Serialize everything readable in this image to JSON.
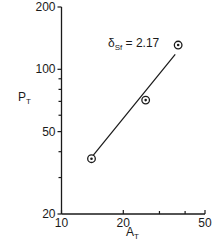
{
  "chart_data": {
    "type": "scatter",
    "title": "",
    "xlabel": "A_T",
    "ylabel": "P_T",
    "xlabel_main": "A",
    "xlabel_sub": "T",
    "ylabel_main": "P",
    "ylabel_sub": "T",
    "xscale": "log",
    "yscale": "log",
    "xlim": [
      10,
      50
    ],
    "ylim": [
      20,
      200
    ],
    "x_ticks": [
      10,
      20,
      50
    ],
    "x_tick_labels": [
      "10",
      "20",
      "50"
    ],
    "x_minor_ticks": [
      30,
      40
    ],
    "y_ticks": [
      20,
      50,
      100,
      200
    ],
    "y_tick_labels": [
      "20",
      "50",
      "100",
      "200"
    ],
    "y_minor_ticks": [
      30,
      40,
      60,
      70,
      80,
      90
    ],
    "grid": false,
    "legend": null,
    "series": [
      {
        "name": "data",
        "marker": "circled-dot",
        "x": [
          14,
          25.7,
          37
        ],
        "y": [
          37,
          71,
          131
        ]
      },
      {
        "name": "fit",
        "style": "line",
        "x": [
          14.3,
          35.8
        ],
        "y": [
          38.5,
          118
        ]
      }
    ],
    "annotations": [
      {
        "text": "δ_Sf = 2.17",
        "main": "δ",
        "sub": "Sf",
        "rest": " = 2.17",
        "x": 17,
        "y": 135
      }
    ]
  }
}
